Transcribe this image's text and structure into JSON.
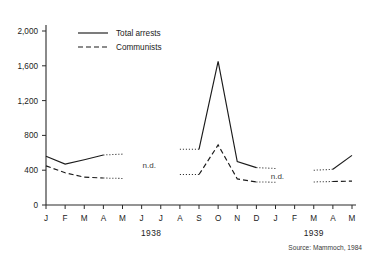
{
  "chart_data": {
    "type": "line",
    "title": "",
    "xlabel": "",
    "ylabel": "",
    "ylim": [
      0,
      2000
    ],
    "yticks": [
      "0",
      "400",
      "800",
      "1,200",
      "1,600",
      "2,000"
    ],
    "ytick_values": [
      0,
      400,
      800,
      1200,
      1600,
      2000
    ],
    "grid": false,
    "legend_position": "top-left-inside",
    "categories": [
      "J",
      "F",
      "M",
      "A",
      "M",
      "J",
      "J",
      "A",
      "S",
      "O",
      "N",
      "D",
      "J",
      "F",
      "M",
      "A",
      "M"
    ],
    "period_labels": [
      {
        "text": "1938",
        "start_index": 0,
        "end_index": 11,
        "center_index": 5.5
      },
      {
        "text": "1939",
        "start_index": 12,
        "end_index": 16,
        "center_index": 14
      }
    ],
    "annotations": [
      {
        "text": "n.d.",
        "x_index": 5.4,
        "y_value": 430
      },
      {
        "text": "n.d.",
        "x_index": 12.1,
        "y_value": 300
      }
    ],
    "source": "Source: Mammoch, 1984",
    "series": [
      {
        "name": "Total arrests",
        "style": "solid",
        "values": [
          560,
          470,
          520,
          575,
          null,
          null,
          null,
          640,
          640,
          1650,
          500,
          430,
          null,
          null,
          400,
          470,
          570
        ],
        "segments": [
          {
            "style": "solid",
            "points": [
              [
                0,
                560
              ],
              [
                1,
                470
              ],
              [
                2,
                520
              ],
              [
                3,
                575
              ]
            ]
          },
          {
            "style": "dotted",
            "points": [
              [
                3,
                575
              ],
              [
                4,
                585
              ]
            ]
          },
          {
            "style": "dotted",
            "points": [
              [
                7,
                640
              ],
              [
                8,
                640
              ]
            ]
          },
          {
            "style": "solid",
            "points": [
              [
                8,
                640
              ],
              [
                9,
                1650
              ],
              [
                10,
                500
              ],
              [
                11,
                430
              ]
            ]
          },
          {
            "style": "dotted",
            "points": [
              [
                11,
                430
              ],
              [
                12,
                420
              ]
            ]
          },
          {
            "style": "dotted",
            "points": [
              [
                14,
                400
              ],
              [
                15,
                410
              ]
            ]
          },
          {
            "style": "solid",
            "points": [
              [
                15,
                410
              ],
              [
                16,
                570
              ]
            ]
          }
        ]
      },
      {
        "name": "Communists",
        "style": "dashed",
        "values": [
          450,
          370,
          320,
          310,
          null,
          null,
          null,
          350,
          350,
          690,
          300,
          265,
          null,
          null,
          265,
          270,
          275
        ],
        "segments": [
          {
            "style": "dashed",
            "points": [
              [
                0,
                450
              ],
              [
                1,
                370
              ],
              [
                2,
                320
              ],
              [
                3,
                310
              ]
            ]
          },
          {
            "style": "dotted",
            "points": [
              [
                3,
                310
              ],
              [
                4,
                305
              ]
            ]
          },
          {
            "style": "dotted",
            "points": [
              [
                7,
                350
              ],
              [
                8,
                350
              ]
            ]
          },
          {
            "style": "dashed",
            "points": [
              [
                8,
                350
              ],
              [
                9,
                690
              ],
              [
                10,
                300
              ],
              [
                11,
                265
              ]
            ]
          },
          {
            "style": "dotted",
            "points": [
              [
                11,
                265
              ],
              [
                12,
                262
              ]
            ]
          },
          {
            "style": "dotted",
            "points": [
              [
                14,
                265
              ],
              [
                15,
                270
              ]
            ]
          },
          {
            "style": "dashed",
            "points": [
              [
                15,
                270
              ],
              [
                16,
                275
              ]
            ]
          }
        ]
      }
    ],
    "legend": [
      {
        "label": "Total arrests",
        "style": "solid"
      },
      {
        "label": "Communists",
        "style": "dashed"
      }
    ]
  }
}
